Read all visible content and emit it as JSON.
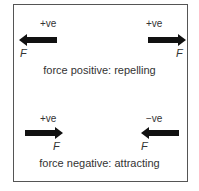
{
  "diagram": {
    "top": {
      "left_sign": "+ve",
      "right_sign": "+ve",
      "left_force": "F",
      "right_force": "F",
      "caption": "force positive: repelling"
    },
    "bottom": {
      "left_sign": "+ve",
      "right_sign": "−ve",
      "left_force": "F",
      "right_force": "F",
      "caption": "force negative: attracting"
    },
    "arrow_color": "#111111"
  }
}
